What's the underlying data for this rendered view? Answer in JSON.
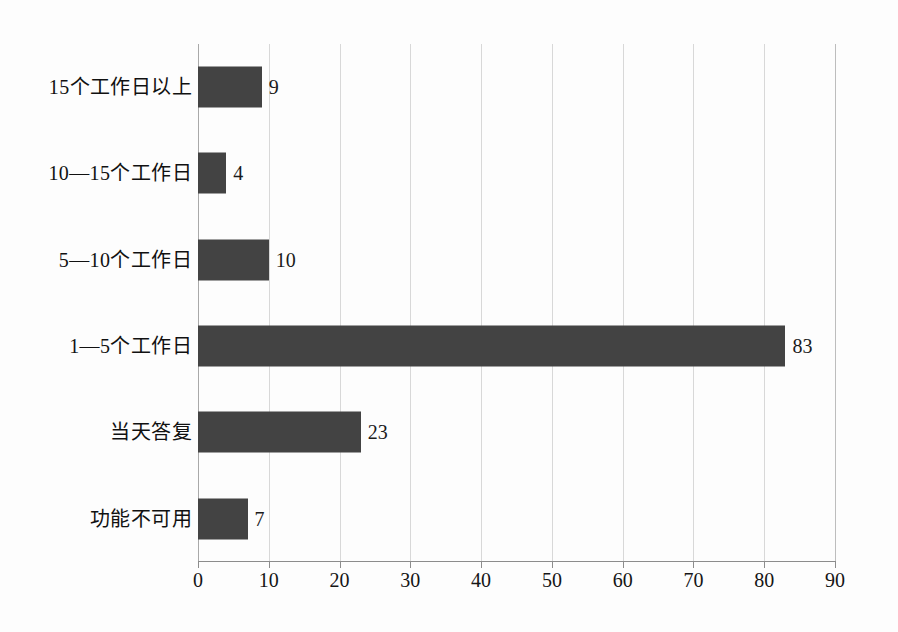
{
  "chart_data": {
    "type": "bar",
    "orientation": "horizontal",
    "title": "",
    "subtitle": "",
    "xlabel": "",
    "ylabel": "",
    "categories": [
      "功能不可用",
      "当天答复",
      "1—5个工作日",
      "5—10个工作日",
      "10—15个工作日",
      "15个工作日以上"
    ],
    "values": [
      7,
      23,
      83,
      10,
      4,
      9
    ],
    "data_labels": [
      "7",
      "23",
      "83",
      "10",
      "4",
      "9"
    ],
    "xlim": [
      0,
      90
    ],
    "xticks": [
      0,
      10,
      20,
      30,
      40,
      50,
      60,
      70,
      80,
      90
    ],
    "xtick_labels": [
      "0",
      "10",
      "20",
      "30",
      "40",
      "50",
      "60",
      "70",
      "80",
      "90"
    ],
    "grid": true,
    "grid_axis": "x",
    "legend": false,
    "legend_position": "none",
    "bar_color": "#434343",
    "grid_color": "#d8d8d8",
    "axis_color": "#8c8c8c",
    "background_color": "#fdfdfd"
  }
}
